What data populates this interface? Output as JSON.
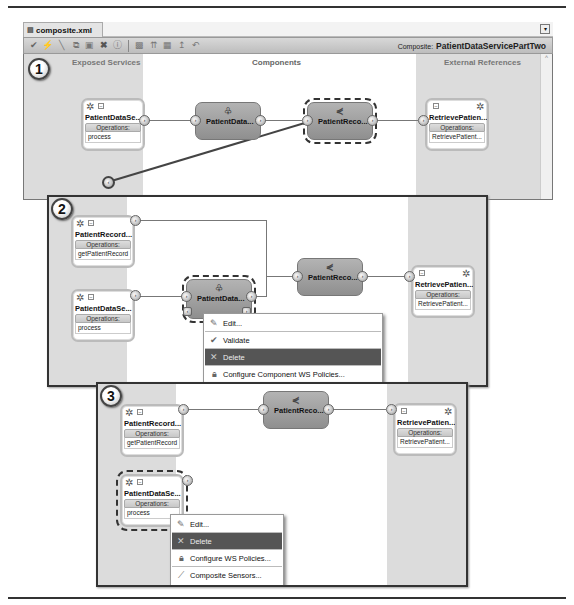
{
  "editor": {
    "tab_label": "composite.xml",
    "composite_prefix": "Composite:",
    "composite_name": "PatientDataServicePartTwo",
    "toolbar_icons": [
      "validate-icon",
      "lightning-icon",
      "wire-icon",
      "copy-icon",
      "paste-icon",
      "delete-icon",
      "info-icon",
      "layout-icon",
      "align-icon",
      "grid-icon",
      "pin-icon",
      "undo-icon"
    ]
  },
  "lanes": {
    "exposed_services": "Exposed Services",
    "components": "Components",
    "external_references": "External References"
  },
  "steps": [
    "1",
    "2",
    "3"
  ],
  "panel1": {
    "service": {
      "name": "PatientDataSe...",
      "ops_label": "Operations:",
      "operation": "process"
    },
    "component_a": {
      "name": "PatientData..."
    },
    "component_b": {
      "name": "PatientReco..."
    },
    "reference": {
      "name": "RetrievePatien...",
      "ops_label": "Operations:",
      "operation": "RetrievePatient..."
    }
  },
  "panel2": {
    "service_a": {
      "name": "PatientRecord...",
      "ops_label": "Operations:",
      "operation": "getPatientRecord"
    },
    "service_b": {
      "name": "PatientDataSe...",
      "ops_label": "Operations:",
      "operation": "process"
    },
    "component_a": {
      "name": "PatientData..."
    },
    "component_b": {
      "name": "PatientReco..."
    },
    "reference": {
      "name": "RetrievePatien...",
      "ops_label": "Operations:",
      "operation": "RetrievePatient..."
    },
    "menu": [
      {
        "label": "Edit...",
        "icon": "pencil-icon"
      },
      {
        "label": "Validate",
        "icon": "checkmark-icon"
      },
      {
        "label": "Delete",
        "icon": "x-icon",
        "active": true
      },
      {
        "label": "Configure Component WS Policies...",
        "icon": "lock-icon"
      }
    ]
  },
  "panel3": {
    "service_a": {
      "name": "PatientRecord...",
      "ops_label": "Operations:",
      "operation": "getPatientRecord"
    },
    "service_b": {
      "name": "PatientDataSe...",
      "ops_label": "Operations:",
      "operation": "process"
    },
    "component_b": {
      "name": "PatientReco..."
    },
    "reference": {
      "name": "RetrievePatien...",
      "ops_label": "Operations:",
      "operation": "RetrievePatient..."
    },
    "menu": [
      {
        "label": "Edit...",
        "icon": "pencil-icon"
      },
      {
        "label": "Delete",
        "icon": "x-icon",
        "active": true
      },
      {
        "label": "Configure WS Policies...",
        "icon": "lock-icon"
      },
      {
        "label": "Composite Sensors...",
        "icon": "sensor-icon"
      }
    ]
  }
}
